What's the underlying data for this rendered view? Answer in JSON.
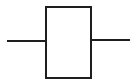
{
  "diagram": {
    "type": "block-component-symbol",
    "stroke_color": "#1e1e1e",
    "background": "#ffffff",
    "elements": [
      {
        "id": "left-lead",
        "kind": "line",
        "x1": 7,
        "y1": 41,
        "x2": 46,
        "y2": 41
      },
      {
        "id": "component-body",
        "kind": "rect",
        "x": 46,
        "y": 6,
        "width": 45,
        "height": 72
      },
      {
        "id": "right-lead",
        "kind": "line",
        "x1": 91,
        "y1": 40,
        "x2": 130,
        "y2": 40
      }
    ]
  }
}
